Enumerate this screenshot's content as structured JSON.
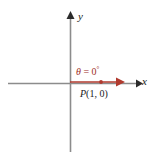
{
  "figure": {
    "background_color": "#ffffff",
    "width": 154,
    "height": 156
  },
  "axes": {
    "color": "#8c8c8c",
    "x_axis": {
      "label": "x",
      "label_name": "axis-label-x",
      "y_position": 83,
      "x_start": 8,
      "x_end": 140,
      "arrow": "right"
    },
    "y_axis": {
      "label": "y",
      "label_name": "axis-label-y",
      "x_position": 70,
      "y_start": 12,
      "y_end": 152,
      "arrow": "up"
    },
    "origin": {
      "x": 70,
      "y": 83
    }
  },
  "ray": {
    "color": "#b03a2e",
    "from_x": 70,
    "from_y": 82,
    "to_x": 124,
    "to_y": 82,
    "arrow": "right",
    "description": "terminal side of angle along positive x-axis"
  },
  "point": {
    "marker_color": "#b03a2e",
    "x": 101,
    "y": 82,
    "label_prefix": "P",
    "label_coords": "(1, 0)",
    "label_full": "P(1, 0)",
    "label_color": "#1a1a1a"
  },
  "angle": {
    "symbol": "θ",
    "equals": " = ",
    "value": "0",
    "unit": "°",
    "label_full": "θ = 0°",
    "color": "#a03028"
  }
}
